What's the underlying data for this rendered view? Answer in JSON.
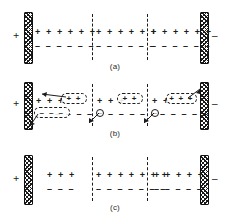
{
  "figure": {
    "type": "schematic-diagram",
    "background": "#ffffff",
    "ink": "#1b1b1b",
    "panel_count": 3
  },
  "symbols": {
    "plus": "+",
    "minus": "–",
    "circled_minus": "–",
    "terminal_positive": "+",
    "terminal_negative": "–"
  },
  "panels": [
    {
      "id": "a",
      "caption": "(a)",
      "left_terminal": "+",
      "right_terminal": "–",
      "cells": [
        {
          "plus_label": "+ + + + + +",
          "minus_label": "– – – – – –",
          "plus_count": 6,
          "minus_count": 6
        },
        {
          "plus_label": "+ + + + + +",
          "minus_label": "– – – – – –",
          "plus_count": 6,
          "minus_count": 6
        },
        {
          "plus_label": "+ + + + + +",
          "minus_label": "– – – – – –",
          "plus_count": 6,
          "minus_count": 6
        }
      ]
    },
    {
      "id": "b",
      "caption": "(b)",
      "left_terminal": "+",
      "right_terminal": "–",
      "cells": [
        {
          "plus_label": "+ + +",
          "minus_label": "– – – –",
          "packet_plus": "+ +",
          "packet_minus": "– – –",
          "circled": "–"
        },
        {
          "plus_label": "+ + +",
          "minus_label": "– – – – –",
          "packet_plus": "+ +",
          "packet_minus": "",
          "circled": "–"
        },
        {
          "plus_label": "+ +",
          "minus_label": "– – – – –",
          "packet_plus": "+ + +",
          "packet_minus": "",
          "circled": "–"
        }
      ]
    },
    {
      "id": "c",
      "caption": "(c)",
      "left_terminal": "+",
      "right_terminal": "–",
      "cells": [
        {
          "plus_label": "+ + +",
          "minus_label": "– – –",
          "plus_count": 3,
          "minus_count": 3
        },
        {
          "plus_label": "+ + + + + + +",
          "minus_label": "– – – – – – –",
          "plus_count": 7,
          "minus_count": 7
        },
        {
          "plus_label": "+ + + + +",
          "minus_label": "– – – – –",
          "plus_count": 5,
          "minus_count": 5
        }
      ]
    }
  ]
}
